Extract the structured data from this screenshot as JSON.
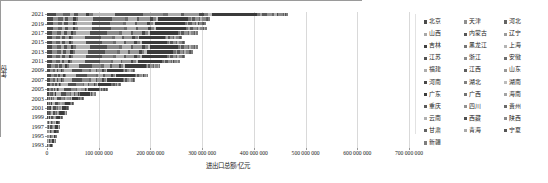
{
  "chart_data": {
    "type": "bar",
    "orientation": "horizontal",
    "stacked": true,
    "title": "",
    "xlabel": "进出口总额/亿元",
    "ylabel": "年份",
    "xlim": [
      0,
      700000000
    ],
    "ylim_categories": [
      "1993",
      "2021"
    ],
    "grid": true,
    "legend_position": "right",
    "xticks": [
      {
        "value": 0,
        "label": "0"
      },
      {
        "value": 100000000,
        "label": "100 000 000"
      },
      {
        "value": 200000000,
        "label": "200 000 000"
      },
      {
        "value": 300000000,
        "label": "300 000 000"
      },
      {
        "value": 400000000,
        "label": "400 000 000"
      },
      {
        "value": 500000000,
        "label": "500 000 000"
      },
      {
        "value": 600000000,
        "label": "600 000 000"
      },
      {
        "value": 700000000,
        "label": "700 000 000"
      }
    ],
    "yticks": [
      "2021",
      "2019",
      "2017",
      "2015",
      "2013",
      "2011",
      "2009",
      "2007",
      "2005",
      "2003",
      "2001",
      "1999",
      "1997",
      "1995",
      "1993"
    ],
    "categories": [
      "1993",
      "1994",
      "1995",
      "1996",
      "1997",
      "1998",
      "1999",
      "2000",
      "2001",
      "2002",
      "2003",
      "2004",
      "2005",
      "2006",
      "2007",
      "2008",
      "2009",
      "2010",
      "2011",
      "2012",
      "2013",
      "2014",
      "2015",
      "2016",
      "2017",
      "2018",
      "2019",
      "2020",
      "2021"
    ],
    "totals": [
      11000000,
      15000000,
      19000000,
      21000000,
      24000000,
      25000000,
      29000000,
      38000000,
      42000000,
      52000000,
      70000000,
      95000000,
      117000000,
      144000000,
      170000000,
      196000000,
      170000000,
      220000000,
      257000000,
      268000000,
      282000000,
      292000000,
      268000000,
      262000000,
      292000000,
      310000000,
      307000000,
      315000000,
      467000000
    ],
    "series": [
      {
        "name": "北京",
        "color": "#4a4a4a"
      },
      {
        "name": "天津",
        "color": "#8f8f8f"
      },
      {
        "name": "河北",
        "color": "#636363"
      },
      {
        "name": "山西",
        "color": "#a8a8a8"
      },
      {
        "name": "内蒙古",
        "color": "#565656"
      },
      {
        "name": "辽宁",
        "color": "#9b9b9b"
      },
      {
        "name": "吉林",
        "color": "#404040"
      },
      {
        "name": "黑龙江",
        "color": "#767676"
      },
      {
        "name": "上海",
        "color": "#b4b4b4"
      },
      {
        "name": "江苏",
        "color": "#515151"
      },
      {
        "name": "浙江",
        "color": "#8a8a8a"
      },
      {
        "name": "安徽",
        "color": "#6d6d6d"
      },
      {
        "name": "福建",
        "color": "#adadad"
      },
      {
        "name": "江西",
        "color": "#5d5d5d"
      },
      {
        "name": "山东",
        "color": "#979797"
      },
      {
        "name": "河南",
        "color": "#474747"
      },
      {
        "name": "湖北",
        "color": "#808080"
      },
      {
        "name": "湖南",
        "color": "#bcbcbc"
      },
      {
        "name": "广东",
        "color": "#3b3b3b"
      },
      {
        "name": "广西",
        "color": "#727272"
      },
      {
        "name": "海南",
        "color": "#a3a3a3"
      },
      {
        "name": "重庆",
        "color": "#5a5a5a"
      },
      {
        "name": "四川",
        "color": "#919191"
      },
      {
        "name": "贵州",
        "color": "#696969"
      },
      {
        "name": "云南",
        "color": "#b0b0b0"
      },
      {
        "name": "西藏",
        "color": "#4e4e4e"
      },
      {
        "name": "陕西",
        "color": "#888888"
      },
      {
        "name": "甘肃",
        "color": "#626262"
      },
      {
        "name": "青海",
        "color": "#a9a9a9"
      },
      {
        "name": "宁夏",
        "color": "#555555"
      },
      {
        "name": "新疆",
        "color": "#7d7d7d"
      }
    ],
    "series_shares": [
      0.035,
      0.03,
      0.028,
      0.014,
      0.02,
      0.03,
      0.014,
      0.015,
      0.09,
      0.11,
      0.08,
      0.02,
      0.055,
      0.012,
      0.06,
      0.02,
      0.018,
      0.014,
      0.18,
      0.014,
      0.008,
      0.02,
      0.022,
      0.006,
      0.012,
      0.003,
      0.02,
      0.006,
      0.003,
      0.004,
      0.01
    ]
  },
  "legend": {
    "items": [
      "北京",
      "天津",
      "河北",
      "山西",
      "内蒙古",
      "辽宁",
      "吉林",
      "黑龙江",
      "上海",
      "江苏",
      "浙江",
      "安徽",
      "福建",
      "江西",
      "山东",
      "河南",
      "湖北",
      "湖南",
      "广东",
      "广西",
      "海南",
      "重庆",
      "四川",
      "贵州",
      "云南",
      "西藏",
      "陕西",
      "甘肃",
      "青海",
      "宁夏",
      "新疆"
    ]
  }
}
